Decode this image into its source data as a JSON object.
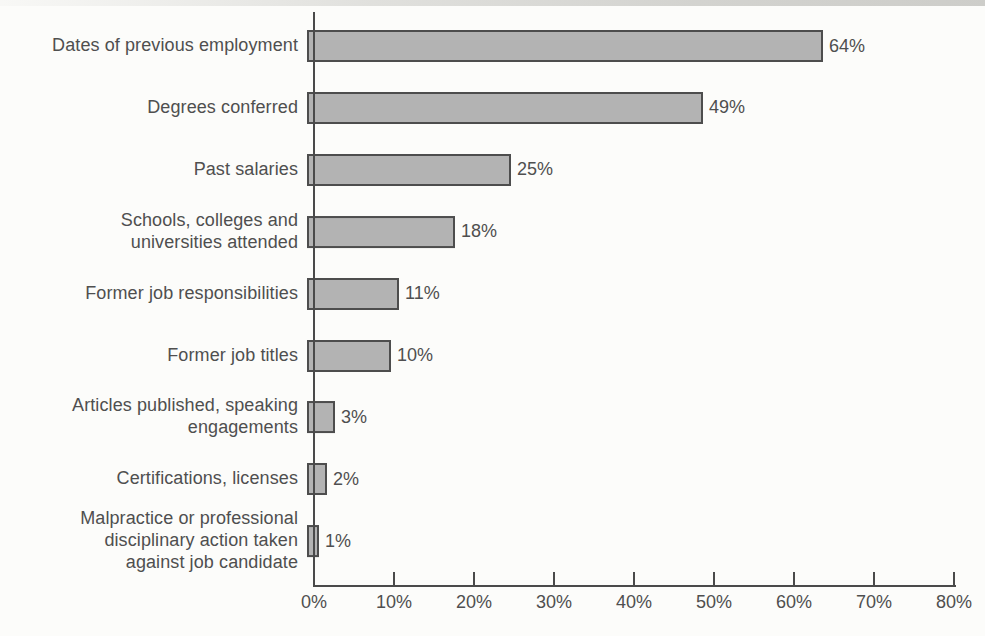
{
  "chart_data": {
    "type": "bar",
    "orientation": "horizontal",
    "title": "",
    "xlabel": "",
    "ylabel": "",
    "grid": false,
    "legend": "none",
    "xlim": [
      0,
      80
    ],
    "x_tick_labels": [
      "0%",
      "10%",
      "20%",
      "30%",
      "40%",
      "50%",
      "60%",
      "70%",
      "80%"
    ],
    "categories": [
      "Dates of previous employment",
      "Degrees conferred",
      "Past salaries",
      "Schools, colleges and\nuniversities attended",
      "Former job responsibilities",
      "Former job titles",
      "Articles published, speaking\nengagements",
      "Certifications, licenses",
      "Malpractice or professional\ndisciplinary action taken\nagainst job candidate"
    ],
    "values": [
      64,
      49,
      25,
      18,
      11,
      10,
      3,
      2,
      1
    ],
    "value_labels": [
      "64%",
      "49%",
      "25%",
      "18%",
      "11%",
      "10%",
      "3%",
      "2%",
      "1%"
    ],
    "colors": {
      "bar_fill": "#b3b3b3",
      "bar_border": "#4d4d4d",
      "axis": "#4a4a4a",
      "text": "#4f4f4f",
      "background": "#fcfcfa"
    }
  }
}
